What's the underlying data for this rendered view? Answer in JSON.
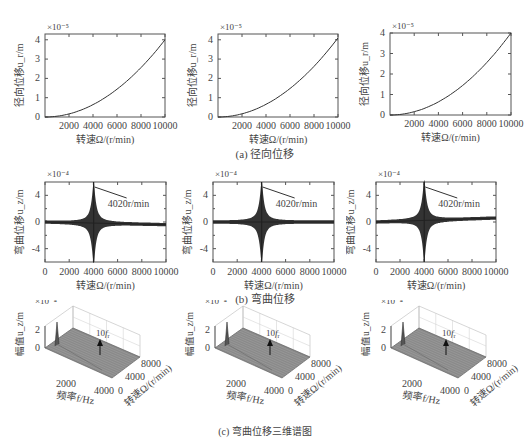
{
  "captions": {
    "a": "(a) 径向位移",
    "b": "(b) 弯曲位移",
    "c": "(c) 弯曲位移三维谱图"
  },
  "row_a": {
    "xlabel": "转速Ω/(r/min)",
    "ylabel": "径向位移u_r/m",
    "exponent": "×10⁻⁵",
    "xticks": [
      "2000",
      "4000",
      "6000",
      "8000",
      "10000"
    ],
    "yticks": [
      "0",
      "1",
      "2",
      "3",
      "4"
    ]
  },
  "row_b": {
    "xlabel": "转速Ω/(r/min)",
    "ylabel": "弯曲位移u_z/m",
    "exponent": "×10⁻⁴",
    "xticks": [
      "0",
      "2000",
      "4000",
      "6000",
      "8000",
      "10000"
    ],
    "yticks": [
      "4",
      "0",
      "-4"
    ],
    "annotation": "4020r/min"
  },
  "row_c": {
    "zlabel": "幅值u_z/m",
    "exponent": "×10⁻⁴",
    "xlabel": "频率f/Hz",
    "ylabel": "转速Ω/(r/min)",
    "zticks": [
      "0",
      "2"
    ],
    "xticks": [
      "2000",
      "4000"
    ],
    "yticks": [
      "0",
      "4000",
      "8000"
    ],
    "annotation": "10f_r"
  },
  "chart_data": [
    {
      "type": "line",
      "title": "径向位移 (1)",
      "xlabel": "转速Ω/(r/min)",
      "ylabel": "径向位移u_r/m (×10⁻⁵)",
      "xlim": [
        0,
        10000
      ],
      "ylim": [
        0,
        4.3
      ],
      "x": [
        0,
        1000,
        2000,
        3000,
        4000,
        5000,
        6000,
        7000,
        8000,
        9000,
        10000
      ],
      "values": [
        0,
        0.04,
        0.16,
        0.36,
        0.64,
        1.0,
        1.44,
        1.96,
        2.56,
        3.24,
        4.0
      ]
    },
    {
      "type": "line",
      "title": "径向位移 (2)",
      "xlabel": "转速Ω/(r/min)",
      "ylabel": "径向位移u_r/m (×10⁻⁵)",
      "xlim": [
        0,
        10000
      ],
      "ylim": [
        0,
        4.3
      ],
      "x": [
        0,
        1000,
        2000,
        3000,
        4000,
        5000,
        6000,
        7000,
        8000,
        9000,
        10000
      ],
      "values": [
        0,
        0.04,
        0.16,
        0.37,
        0.66,
        1.03,
        1.48,
        2.01,
        2.62,
        3.32,
        4.1
      ]
    },
    {
      "type": "line",
      "title": "径向位移 (3)",
      "xlabel": "转速Ω/(r/min)",
      "ylabel": "径向位移u_r/m (×10⁻⁵)",
      "xlim": [
        0,
        10000
      ],
      "ylim": [
        0,
        4
      ],
      "x": [
        0,
        1000,
        2000,
        3000,
        4000,
        5000,
        6000,
        7000,
        8000,
        9000,
        10000
      ],
      "values": [
        0,
        0.04,
        0.16,
        0.36,
        0.64,
        1.0,
        1.44,
        1.96,
        2.56,
        3.24,
        4.0
      ]
    },
    {
      "type": "line",
      "title": "弯曲位移 (1)",
      "xlabel": "转速Ω/(r/min)",
      "ylabel": "弯曲位移u_z/m (×10⁻⁴)",
      "xlim": [
        0,
        10000
      ],
      "ylim": [
        -6,
        6
      ],
      "annotation": "4020r/min",
      "peak_x": 4020,
      "peak_amplitude": 6,
      "baseline_start": 0,
      "baseline_end": -0.4
    },
    {
      "type": "line",
      "title": "弯曲位移 (2)",
      "xlabel": "转速Ω/(r/min)",
      "ylabel": "弯曲位移u_z/m (×10⁻⁴)",
      "xlim": [
        0,
        10000
      ],
      "ylim": [
        -6,
        6
      ],
      "annotation": "4020r/min",
      "peak_x": 4020,
      "peak_amplitude": 6,
      "baseline_start": 0,
      "baseline_end": 0
    },
    {
      "type": "line",
      "title": "弯曲位移 (3)",
      "xlabel": "转速Ω/(r/min)",
      "ylabel": "弯曲位移u_z/m (×10⁻⁴)",
      "xlim": [
        0,
        10000
      ],
      "ylim": [
        -6,
        6
      ],
      "annotation": "4020r/min",
      "peak_x": 4020,
      "peak_amplitude": 6,
      "baseline_start": 0,
      "baseline_end": 0.6
    },
    {
      "type": "surface3d",
      "title": "弯曲位移三维谱图 (1)",
      "xlabel": "频率f/Hz",
      "ylabel": "转速Ω/(r/min)",
      "zlabel": "幅值u_z/m (×10⁻⁴)",
      "xticks": [
        2000,
        4000
      ],
      "yticks": [
        0,
        4000,
        8000
      ],
      "zticks": [
        0,
        2
      ],
      "annotation": "10f_r"
    },
    {
      "type": "surface3d",
      "title": "弯曲位移三维谱图 (2)",
      "xlabel": "频率f/Hz",
      "ylabel": "转速Ω/(r/min)",
      "zlabel": "幅值u_z/m (×10⁻⁴)",
      "xticks": [
        2000,
        4000
      ],
      "yticks": [
        0,
        4000,
        8000
      ],
      "zticks": [
        0,
        2
      ],
      "annotation": "10f_r"
    },
    {
      "type": "surface3d",
      "title": "弯曲位移三维谱图 (3)",
      "xlabel": "频率f/Hz",
      "ylabel": "转速Ω/(r/min)",
      "zlabel": "幅值u_z/m (×10⁻⁴)",
      "xticks": [
        2000,
        4000
      ],
      "yticks": [
        0,
        4000,
        8000
      ],
      "zticks": [
        0,
        2
      ],
      "annotation": "10f_r"
    }
  ]
}
